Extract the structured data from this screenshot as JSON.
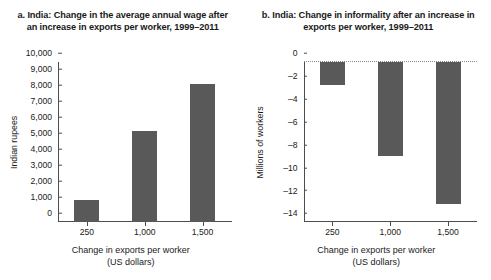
{
  "figure": {
    "panels": [
      {
        "title": "a. India: Change in the average annual wage after an increase in exports per worker, 1999–2011",
        "ylabel": "Indian rupees",
        "xlabel_line1": "Change in exports per worker",
        "xlabel_line2": "(US dollars)",
        "yticks": [
          "0",
          "1,000",
          "2,000",
          "3,000",
          "4,000",
          "5,000",
          "6,000",
          "7,000",
          "8,000",
          "9,000",
          "10,000"
        ],
        "xticks": [
          "250",
          "1,000",
          "1,500"
        ]
      },
      {
        "title": "b. India: Change in informality after an increase in exports per worker, 1999–2011",
        "ylabel": "Millions of workers",
        "xlabel_line1": "Change in exports per worker",
        "xlabel_line2": "(US dollars)",
        "yticks": [
          "0",
          "–2",
          "–4",
          "–6",
          "–8",
          "–10",
          "–12",
          "–14"
        ],
        "xticks": [
          "250",
          "1,000",
          "1,500"
        ]
      }
    ],
    "bar_color": "#595959",
    "axis_color": "#4d4d4d"
  },
  "chart_data": [
    {
      "type": "bar",
      "title": "a. India: Change in the average annual wage after an increase in exports per worker, 1999–2011",
      "categories": [
        "250",
        "1,000",
        "1,500"
      ],
      "values": [
        1400,
        5700,
        8600
      ],
      "xlabel": "Change in exports per worker (US dollars)",
      "ylabel": "Indian rupees",
      "ylim": [
        0,
        10000
      ],
      "ytick_values": [
        0,
        1000,
        2000,
        3000,
        4000,
        5000,
        6000,
        7000,
        8000,
        9000,
        10000
      ],
      "grid": false,
      "legend": "none"
    },
    {
      "type": "bar",
      "title": "b. India: Change in informality after an increase in exports per worker, 1999–2011",
      "categories": [
        "250",
        "1,000",
        "1,500"
      ],
      "values": [
        -2.0,
        -8.2,
        -12.4
      ],
      "xlabel": "Change in exports per worker (US dollars)",
      "ylabel": "Millions of workers",
      "ylim": [
        -14,
        0
      ],
      "ytick_values": [
        0,
        -2,
        -4,
        -6,
        -8,
        -10,
        -12,
        -14
      ],
      "grid": false,
      "zero_line": "dotted",
      "legend": "none"
    }
  ]
}
